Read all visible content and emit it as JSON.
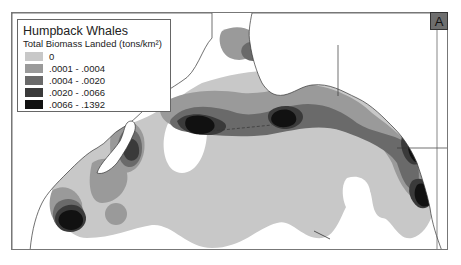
{
  "map": {
    "panel_label": "A",
    "region": "North Pacific Ocean",
    "legend": {
      "title": "Humpback Whales",
      "subtitle": "Total Biomass Landed (tons/km²)",
      "classes": [
        {
          "label": "0",
          "color": "#c8c8c8"
        },
        {
          "label": ".0001 - .0004",
          "color": "#9a9a9a"
        },
        {
          "label": ".0004 - .0020",
          "color": "#6a6a6a"
        },
        {
          "label": ".0020 - .0066",
          "color": "#3a3a3a"
        },
        {
          "label": ".0066 - .1392",
          "color": "#111111"
        }
      ]
    },
    "colors": {
      "background": "#ffffff",
      "frame": "#777777",
      "coastline": "#333333"
    }
  }
}
